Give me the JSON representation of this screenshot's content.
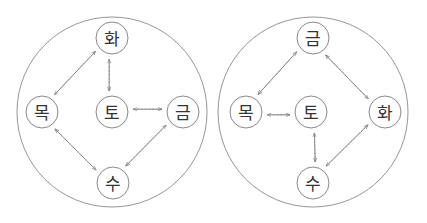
{
  "colors": {
    "circle_stroke": "#7a7a7a",
    "text": "#333333",
    "solid_arrow": "#6a6a6a",
    "dashed_arrow": "#8a8a8a",
    "background": "#ffffff"
  },
  "legend": {
    "solid": "solid arrow",
    "dashed": "dashed arrow"
  },
  "diagrams": [
    {
      "id": "left",
      "outer": {
        "cx": 112,
        "cy": 112,
        "r": 95
      },
      "nodes": [
        {
          "id": "hwa",
          "label": "화",
          "cx": 112,
          "cy": 38
        },
        {
          "id": "mok",
          "label": "목",
          "cx": 42,
          "cy": 112
        },
        {
          "id": "to",
          "label": "토",
          "cx": 112,
          "cy": 112
        },
        {
          "id": "geum",
          "label": "금",
          "cx": 183,
          "cy": 112
        },
        {
          "id": "su",
          "label": "수",
          "cx": 113,
          "cy": 183
        }
      ],
      "edges": [
        {
          "from": "mok",
          "to": "hwa",
          "style": "solid"
        },
        {
          "from": "hwa",
          "to": "mok",
          "style": "dashed"
        },
        {
          "from": "hwa",
          "to": "to",
          "style": "solid"
        },
        {
          "from": "to",
          "to": "hwa",
          "style": "dashed"
        },
        {
          "from": "to",
          "to": "geum",
          "style": "solid"
        },
        {
          "from": "geum",
          "to": "to",
          "style": "dashed"
        },
        {
          "from": "geum",
          "to": "su",
          "style": "solid"
        },
        {
          "from": "su",
          "to": "geum",
          "style": "dashed"
        },
        {
          "from": "su",
          "to": "mok",
          "style": "solid"
        },
        {
          "from": "mok",
          "to": "su",
          "style": "dashed"
        }
      ]
    },
    {
      "id": "right",
      "outer": {
        "cx": 313,
        "cy": 112,
        "r": 95
      },
      "nodes": [
        {
          "id": "geum",
          "label": "금",
          "cx": 313,
          "cy": 38
        },
        {
          "id": "mok",
          "label": "목",
          "cx": 246,
          "cy": 112
        },
        {
          "id": "to",
          "label": "토",
          "cx": 311,
          "cy": 112
        },
        {
          "id": "hwa",
          "label": "화",
          "cx": 385,
          "cy": 112
        },
        {
          "id": "su",
          "label": "수",
          "cx": 313,
          "cy": 183
        }
      ],
      "edges": [
        {
          "from": "geum",
          "to": "mok",
          "style": "solid"
        },
        {
          "from": "mok",
          "to": "geum",
          "style": "dashed"
        },
        {
          "from": "hwa",
          "to": "geum",
          "style": "solid"
        },
        {
          "from": "geum",
          "to": "hwa",
          "style": "dashed"
        },
        {
          "from": "mok",
          "to": "to",
          "style": "solid"
        },
        {
          "from": "to",
          "to": "mok",
          "style": "dashed"
        },
        {
          "from": "to",
          "to": "su",
          "style": "solid"
        },
        {
          "from": "su",
          "to": "to",
          "style": "dashed"
        },
        {
          "from": "su",
          "to": "hwa",
          "style": "solid"
        },
        {
          "from": "hwa",
          "to": "su",
          "style": "dashed"
        }
      ]
    }
  ],
  "node_radius": 16
}
